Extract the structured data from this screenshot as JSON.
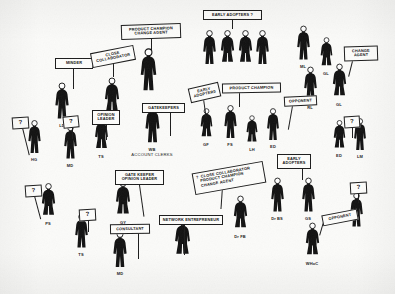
{
  "diagram": {
    "background_color": "#fbfbf9",
    "ink_color": "#111111",
    "figures": [
      {
        "id": "f_lb",
        "initials": "LD",
        "sub": "",
        "x": 62,
        "y": 82,
        "h": 40,
        "sex": "m"
      },
      {
        "id": "f_md1",
        "initials": "MD",
        "sub": "",
        "x": 112,
        "y": 77,
        "h": 40,
        "sex": "f"
      },
      {
        "id": "f_pc",
        "initials": "",
        "sub": "",
        "x": 148,
        "y": 48,
        "h": 46,
        "sex": "m"
      },
      {
        "id": "f_gk",
        "initials": "WB",
        "sub": "ACCOUNT CLERKS",
        "x": 152,
        "y": 104,
        "h": 42,
        "sex": "m"
      },
      {
        "id": "f_ea1",
        "initials": "",
        "sub": "",
        "x": 209,
        "y": 30,
        "h": 37,
        "sex": "m"
      },
      {
        "id": "f_ea2",
        "initials": "",
        "sub": "",
        "x": 227,
        "y": 30,
        "h": 37,
        "sex": "f"
      },
      {
        "id": "f_ea3",
        "initials": "",
        "sub": "",
        "x": 245,
        "y": 30,
        "h": 37,
        "sex": "f"
      },
      {
        "id": "f_ea4",
        "initials": "",
        "sub": "",
        "x": 262,
        "y": 30,
        "h": 37,
        "sex": "m"
      },
      {
        "id": "f_ml",
        "initials": "ML",
        "sub": "",
        "x": 303,
        "y": 25,
        "h": 38,
        "sex": "m"
      },
      {
        "id": "f_gl1",
        "initials": "GL",
        "sub": "",
        "x": 326,
        "y": 37,
        "h": 33,
        "sex": "f"
      },
      {
        "id": "f_rl",
        "initials": "RL",
        "sub": "",
        "x": 310,
        "y": 66,
        "h": 38,
        "sex": "m"
      },
      {
        "id": "f_gl2",
        "initials": "GL",
        "sub": "",
        "x": 339,
        "y": 63,
        "h": 38,
        "sex": "f"
      },
      {
        "id": "f_hg",
        "initials": "HG",
        "sub": "",
        "x": 34,
        "y": 120,
        "h": 36,
        "sex": "m"
      },
      {
        "id": "f_md2",
        "initials": "MD",
        "sub": "",
        "x": 70,
        "y": 124,
        "h": 38,
        "sex": "m"
      },
      {
        "id": "f_ts1",
        "initials": "TS",
        "sub": "",
        "x": 101,
        "y": 117,
        "h": 36,
        "sex": "f"
      },
      {
        "id": "f_gf",
        "initials": "GF",
        "sub": "",
        "x": 206,
        "y": 108,
        "h": 33,
        "sex": "f"
      },
      {
        "id": "f_fs",
        "initials": "FS",
        "sub": "",
        "x": 230,
        "y": 105,
        "h": 36,
        "sex": "m"
      },
      {
        "id": "f_lh",
        "initials": "LH",
        "sub": "",
        "x": 252,
        "y": 115,
        "h": 31,
        "sex": "f"
      },
      {
        "id": "f_ed1",
        "initials": "ED",
        "sub": "",
        "x": 273,
        "y": 108,
        "h": 35,
        "sex": "m"
      },
      {
        "id": "f_ed2",
        "initials": "ED",
        "sub": "",
        "x": 339,
        "y": 120,
        "h": 32,
        "sex": "f"
      },
      {
        "id": "f_lm",
        "initials": "LM",
        "sub": "",
        "x": 360,
        "y": 118,
        "h": 35,
        "sex": "m"
      },
      {
        "id": "f_ps",
        "initials": "PS",
        "sub": "",
        "x": 48,
        "y": 183,
        "h": 37,
        "sex": "f"
      },
      {
        "id": "f_gy",
        "initials": "GY",
        "sub": "",
        "x": 123,
        "y": 180,
        "h": 39,
        "sex": "f"
      },
      {
        "id": "f_ts2",
        "initials": "TS",
        "sub": "",
        "x": 81,
        "y": 213,
        "h": 38,
        "sex": "m"
      },
      {
        "id": "f_md3",
        "initials": "MD",
        "sub": "",
        "x": 120,
        "y": 231,
        "h": 39,
        "sex": "m"
      },
      {
        "id": "f_ne",
        "initials": "",
        "sub": "",
        "x": 182,
        "y": 218,
        "h": 42,
        "sex": "f"
      },
      {
        "id": "f_drfb",
        "initials": "Dr FB",
        "sub": "",
        "x": 240,
        "y": 195,
        "h": 38,
        "sex": "f"
      },
      {
        "id": "f_drbs",
        "initials": "Dr BS",
        "sub": "",
        "x": 277,
        "y": 177,
        "h": 38,
        "sex": "m"
      },
      {
        "id": "f_gs",
        "initials": "GS",
        "sub": "",
        "x": 308,
        "y": 177,
        "h": 38,
        "sex": "m"
      },
      {
        "id": "f_whoc",
        "initials": "WHoC",
        "sub": "",
        "x": 312,
        "y": 222,
        "h": 38,
        "sex": "f"
      },
      {
        "id": "f_right",
        "initials": "",
        "sub": "",
        "x": 356,
        "y": 192,
        "h": 38,
        "sex": "m"
      }
    ],
    "placards": [
      {
        "id": "p_minder",
        "text": "MINDER",
        "x": 55,
        "y": 58,
        "w": 38,
        "h": 11,
        "rot": 0,
        "stick": {
          "x": 73,
          "y": 69,
          "len": 20,
          "rot": 0
        }
      },
      {
        "id": "p_close_collab",
        "text": "CLOSE\nCOLLABORATOR",
        "x": 91,
        "y": 49,
        "w": 44,
        "h": 15,
        "rot": -11,
        "stick": {
          "x": 113,
          "y": 63,
          "len": 14,
          "rot": 0
        }
      },
      {
        "id": "p_prod_champ_change",
        "text": "PRODUCT CHAMPION\nCHANGE AGENT",
        "x": 121,
        "y": 24,
        "w": 60,
        "h": 15,
        "rot": -2,
        "stick": {
          "x": 151,
          "y": 39,
          "len": 12,
          "rot": 0
        }
      },
      {
        "id": "p_early_adopters_q",
        "text": "EARLY ADOPTERS ?",
        "x": 203,
        "y": 10,
        "w": 59,
        "h": 10,
        "rot": 0,
        "stick": {
          "x": 232,
          "y": 20,
          "len": 9,
          "rot": 0
        }
      },
      {
        "id": "p_change_agent",
        "text": "CHANGE\nAGENT",
        "x": 344,
        "y": 46,
        "w": 34,
        "h": 15,
        "rot": -2,
        "stick": {
          "x": 352,
          "y": 61,
          "len": 16,
          "rot": 14
        }
      },
      {
        "id": "p_gatekeepers",
        "text": "GATEKEEPERS",
        "x": 142,
        "y": 103,
        "w": 43,
        "h": 9,
        "rot": 0,
        "stick": {
          "x": 170,
          "y": 112,
          "len": 24,
          "rot": 0
        }
      },
      {
        "id": "p_early_adopters2",
        "text": "EARLY\nADOPTERS",
        "x": 189,
        "y": 85,
        "w": 31,
        "h": 14,
        "rot": -13,
        "stick": {
          "x": 203,
          "y": 99,
          "len": 19,
          "rot": -8
        }
      },
      {
        "id": "p_product_champion",
        "text": "PRODUCT CHAMPION",
        "x": 222,
        "y": 83,
        "w": 59,
        "h": 10,
        "rot": -1,
        "stick": {
          "x": 239,
          "y": 93,
          "len": 14,
          "rot": 0
        }
      },
      {
        "id": "p_opponent1",
        "text": "OPPONENT",
        "x": 284,
        "y": 96,
        "w": 33,
        "h": 10,
        "rot": -3,
        "stick": {
          "x": 292,
          "y": 106,
          "len": 24,
          "rot": 10
        }
      },
      {
        "id": "p_q_left1",
        "text": "?",
        "x": 12,
        "y": 117,
        "w": 17,
        "h": 11,
        "rot": -4,
        "stick": {
          "x": 22,
          "y": 128,
          "len": 28,
          "rot": -14
        }
      },
      {
        "id": "p_opinion_leader",
        "text": "OPINION\nLEADER",
        "x": 92,
        "y": 110,
        "w": 28,
        "h": 14,
        "rot": 0,
        "stick": {
          "x": 106,
          "y": 124,
          "len": 16,
          "rot": 0
        }
      },
      {
        "id": "p_q_left2",
        "text": "?",
        "x": 63,
        "y": 116,
        "w": 16,
        "h": 11,
        "rot": -6,
        "stick": {
          "x": 72,
          "y": 126,
          "len": 13,
          "rot": 0
        }
      },
      {
        "id": "p_q_right1",
        "text": "?",
        "x": 344,
        "y": 116,
        "w": 16,
        "h": 11,
        "rot": -4,
        "stick": {
          "x": 352,
          "y": 126,
          "len": 12,
          "rot": 0
        }
      },
      {
        "id": "p_gate_opinion",
        "text": "GATE KEEPER\nOPINION LEADER",
        "x": 115,
        "y": 170,
        "w": 49,
        "h": 15,
        "rot": 0,
        "stick": {
          "x": 139,
          "y": 185,
          "len": 32,
          "rot": -8
        }
      },
      {
        "id": "p_q_left3",
        "text": "?",
        "x": 25,
        "y": 185,
        "w": 17,
        "h": 11,
        "rot": -4,
        "stick": {
          "x": 34,
          "y": 196,
          "len": 24,
          "rot": -15
        }
      },
      {
        "id": "p_q_mid",
        "text": "?",
        "x": 79,
        "y": 209,
        "w": 17,
        "h": 11,
        "rot": -3,
        "stick": {
          "x": 88,
          "y": 220,
          "len": 12,
          "rot": 0
        }
      },
      {
        "id": "p_consultant",
        "text": "CONSULTANT",
        "x": 110,
        "y": 224,
        "w": 40,
        "h": 9,
        "rot": -1,
        "stick": {
          "x": 138,
          "y": 233,
          "len": 26,
          "rot": 0
        }
      },
      {
        "id": "p_network_entre",
        "text": "NETWORK ENTREPRENEUR",
        "x": 159,
        "y": 215,
        "w": 64,
        "h": 10,
        "rot": 0,
        "stick": {
          "x": 184,
          "y": 225,
          "len": 30,
          "rot": 0
        }
      },
      {
        "id": "p_combo",
        "text": "?  CLOSE COLLABORATOR\n   PRODUCT CHAMPION\n   CHANGE AGENT",
        "x": 193,
        "y": 167,
        "w": 72,
        "h": 22,
        "rot": -10,
        "stick": {
          "x": 222,
          "y": 187,
          "len": 22,
          "rot": 4
        }
      },
      {
        "id": "p_early_adopters3",
        "text": "EARLY\nADOPTERS",
        "x": 277,
        "y": 154,
        "w": 34,
        "h": 14,
        "rot": 0,
        "stick": {
          "x": 302,
          "y": 168,
          "len": 12,
          "rot": 0
        }
      },
      {
        "id": "p_opponent2",
        "text": "OPPONENT",
        "x": 322,
        "y": 212,
        "w": 36,
        "h": 11,
        "rot": -11,
        "stick": {
          "x": 323,
          "y": 222,
          "len": 14,
          "rot": 16
        }
      },
      {
        "id": "p_q_right2",
        "text": "?",
        "x": 350,
        "y": 182,
        "w": 17,
        "h": 11,
        "rot": -3,
        "stick": {
          "x": 358,
          "y": 193,
          "len": 10,
          "rot": 0
        }
      }
    ]
  }
}
